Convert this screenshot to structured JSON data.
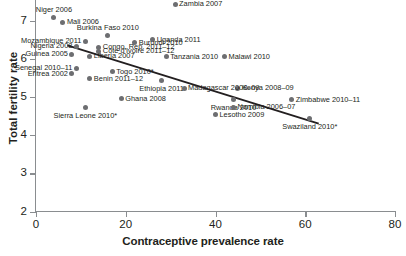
{
  "chart_data": {
    "type": "scatter",
    "title": "",
    "xlabel": "Contraceptive prevalence rate",
    "ylabel": "Total fertility rate",
    "xlim": [
      0,
      80
    ],
    "ylim": [
      2,
      7.5
    ],
    "xticks": [
      0,
      20,
      40,
      60,
      80
    ],
    "yticks": [
      2,
      3,
      4,
      5,
      6,
      7
    ],
    "grid": false,
    "legend": null,
    "marker_color": "#6d6e71",
    "trendline_color": "#231f20",
    "trendline": {
      "x0": 7,
      "y0": 6.35,
      "x1": 63,
      "y1": 4.3
    },
    "points": [
      {
        "label": "Niger 2006",
        "x": 4,
        "y": 7.09,
        "label_pos": "above"
      },
      {
        "label": "Mali 2006",
        "x": 6,
        "y": 6.96,
        "label_pos": "right"
      },
      {
        "label": "Zambia 2007",
        "x": 31,
        "y": 7.42,
        "label_pos": "right"
      },
      {
        "label": "Burkina Faso 2010",
        "x": 16,
        "y": 6.62,
        "label_pos": "above"
      },
      {
        "label": "Uganda 2011",
        "x": 26,
        "y": 6.49,
        "label_pos": "right"
      },
      {
        "label": "Mozambique 2011",
        "x": 11,
        "y": 6.46,
        "label_pos": "left"
      },
      {
        "label": "Burundi 2010",
        "x": 22,
        "y": 6.42,
        "label_pos": "right"
      },
      {
        "label": "Nigeria 2008",
        "x": 9,
        "y": 6.33,
        "label_pos": "left"
      },
      {
        "label": "Congo, Rep. 2011–12",
        "x": 14,
        "y": 6.3,
        "label_pos": "right"
      },
      {
        "label": "Côte d'Ivoire 2011–12",
        "x": 14,
        "y": 6.2,
        "label_pos": "right"
      },
      {
        "label": "Guinea 2005",
        "x": 8,
        "y": 6.12,
        "label_pos": "left"
      },
      {
        "label": "Liberia 2007",
        "x": 12,
        "y": 6.06,
        "label_pos": "right"
      },
      {
        "label": "Tanzania 2010",
        "x": 29,
        "y": 6.05,
        "label_pos": "right"
      },
      {
        "label": "Malawi 2010",
        "x": 42,
        "y": 6.05,
        "label_pos": "right"
      },
      {
        "label": "Senegal 2010–11",
        "x": 9,
        "y": 5.75,
        "label_pos": "left"
      },
      {
        "label": "Togo 2010*",
        "x": 17,
        "y": 5.66,
        "label_pos": "right"
      },
      {
        "label": "Eritrea 2002",
        "x": 8,
        "y": 5.6,
        "label_pos": "left"
      },
      {
        "label": "Benin 2011–12",
        "x": 12,
        "y": 5.48,
        "label_pos": "right"
      },
      {
        "label": "Ethiopia 2011",
        "x": 28,
        "y": 5.42,
        "label_pos": "below"
      },
      {
        "label": "Kenya 2008–09",
        "x": 45,
        "y": 5.22,
        "label_pos": "right"
      },
      {
        "label": "Madagascar 2008–09",
        "x": 33,
        "y": 5.22,
        "label_pos": "right"
      },
      {
        "label": "Ghana 2008",
        "x": 19,
        "y": 4.95,
        "label_pos": "right"
      },
      {
        "label": "Rwanda 2010",
        "x": 44,
        "y": 4.93,
        "label_pos": "below"
      },
      {
        "label": "Zimbabwe 2010–11",
        "x": 57,
        "y": 4.92,
        "label_pos": "right"
      },
      {
        "label": "Sierra Leone 2010*",
        "x": 11,
        "y": 4.71,
        "label_pos": "below"
      },
      {
        "label": "Namibia 2006–07",
        "x": 44,
        "y": 4.73,
        "label_pos": "right"
      },
      {
        "label": "Lesotho 2009",
        "x": 40,
        "y": 4.53,
        "label_pos": "right"
      },
      {
        "label": "Swaziland 2010*",
        "x": 61,
        "y": 4.43,
        "label_pos": "below"
      }
    ]
  }
}
